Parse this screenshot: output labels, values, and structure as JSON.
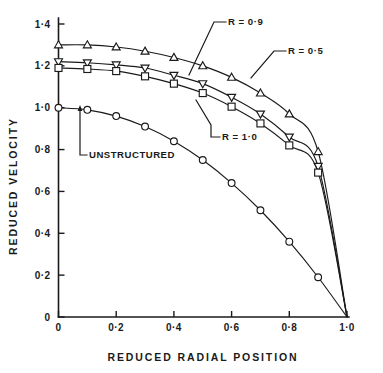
{
  "chart_data": {
    "type": "line",
    "title": "",
    "xlabel": "REDUCED  RADIAL  POSITION",
    "ylabel": "REDUCED VELOCITY",
    "xlim": [
      0,
      1.0
    ],
    "ylim": [
      0,
      1.4
    ],
    "grid": false,
    "legend_position": "inline-annotations",
    "x_tick_labels": [
      "0",
      "0·2",
      "0·4",
      "0·6",
      "0·8",
      "1·0"
    ],
    "x_tick_values": [
      0,
      0.2,
      0.4,
      0.6,
      0.8,
      1.0
    ],
    "y_tick_labels": [
      "0",
      "0·2",
      "0·4",
      "0·6",
      "0·8",
      "1·0",
      "1·2",
      "1·4"
    ],
    "y_tick_values": [
      0,
      0.2,
      0.4,
      0.6,
      0.8,
      1.0,
      1.2,
      1.4
    ],
    "x": [
      0,
      0.1,
      0.2,
      0.3,
      0.4,
      0.5,
      0.6,
      0.7,
      0.8,
      0.9,
      1.0
    ],
    "series": [
      {
        "name": "R = 0·9",
        "marker": "triangle-up",
        "values": [
          1.3,
          1.3,
          1.29,
          1.27,
          1.24,
          1.2,
          1.145,
          1.07,
          0.97,
          0.79,
          0.0
        ]
      },
      {
        "name": "R = 0·5",
        "marker": "triangle-down",
        "values": [
          1.22,
          1.215,
          1.205,
          1.19,
          1.155,
          1.115,
          1.05,
          0.97,
          0.86,
          0.72,
          0.0
        ]
      },
      {
        "name": "R = 1·0",
        "marker": "square",
        "values": [
          1.19,
          1.185,
          1.175,
          1.15,
          1.115,
          1.07,
          1.005,
          0.925,
          0.82,
          0.69,
          0.0
        ]
      },
      {
        "name": "UNSTRUCTURED",
        "marker": "circle",
        "values": [
          1.0,
          0.99,
          0.96,
          0.91,
          0.84,
          0.75,
          0.64,
          0.51,
          0.36,
          0.19,
          0.0
        ]
      }
    ],
    "annotations": [
      {
        "text": "R = 0·9",
        "series": "R = 0·9"
      },
      {
        "text": "R = 0·5",
        "series": "R = 0·5"
      },
      {
        "text": "R = 1·0",
        "series": "R = 1·0"
      },
      {
        "text": "UNSTRUCTURED",
        "series": "UNSTRUCTURED"
      }
    ]
  },
  "axes": {
    "x_title": "REDUCED  RADIAL  POSITION",
    "y_title": "REDUCED VELOCITY",
    "x_ticks": [
      "0",
      "0·2",
      "0·4",
      "0·6",
      "0·8",
      "1·0"
    ],
    "y_ticks": [
      "0",
      "0·2",
      "0·4",
      "0·6",
      "0·8",
      "1·0",
      "1·2",
      "1·4"
    ],
    "y_origin_label": "0",
    "x_origin_label": "0"
  },
  "labels": {
    "r09": "R = 0·9",
    "r05": "R = 0·5",
    "r10": "R = 1·0",
    "unstructured": "UNSTRUCTURED"
  },
  "colors": {
    "ink": "#1a1a1a",
    "paper": "#ffffff"
  }
}
